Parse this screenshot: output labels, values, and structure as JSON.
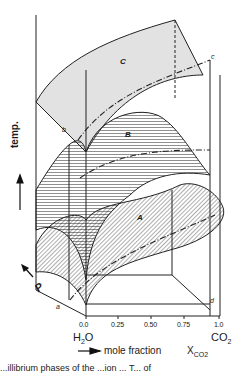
{
  "figure": {
    "axes": {
      "vertical_label": "temp.",
      "depth_label": "P",
      "x_label": "mole fraction",
      "x_variable": "X",
      "x_variable_sub": "CO2",
      "x_ticks": [
        "0.0",
        "0.25",
        "0.50",
        "0.75",
        "1.0"
      ],
      "left_component": {
        "base": "H",
        "sub": "2",
        "tail": "O"
      },
      "right_component": {
        "base": "CO",
        "sub": "2",
        "tail": ""
      }
    },
    "surfaces": [
      {
        "label": "A",
        "description": "lower hatched surface"
      },
      {
        "label": "B",
        "description": "middle hatched surface"
      },
      {
        "label": "C",
        "description": "upper shaded surface"
      }
    ],
    "points": [
      {
        "label": "a"
      },
      {
        "label": "b"
      },
      {
        "label": "c"
      },
      {
        "label": "d"
      }
    ],
    "caption": "...illibrium phases of the ...ion ...  T... of"
  }
}
